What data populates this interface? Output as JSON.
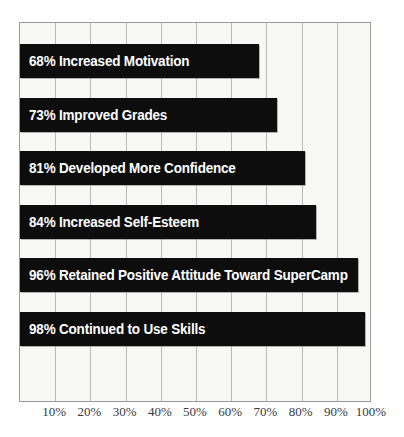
{
  "chart_data": {
    "type": "bar",
    "orientation": "horizontal",
    "title": "",
    "subtitle": "",
    "xlabel": "",
    "ylabel": "",
    "xlim": [
      0,
      100
    ],
    "grid": true,
    "legend": null,
    "value_suffix": "%",
    "categories": [
      "Increased Motivation",
      "Improved Grades",
      "Developed More Confidence",
      "Increased Self-Esteem",
      "Retained Positive Attitude Toward SuperCamp",
      "Continued to Use Skills"
    ],
    "values": [
      68,
      73,
      81,
      84,
      96,
      98
    ],
    "bar_labels": [
      "68% Increased Motivation",
      "73% Improved Grades",
      "81% Developed More Confidence",
      "84% Increased Self-Esteem",
      "96% Retained Positive Attitude Toward SuperCamp",
      "98% Continued to Use Skills"
    ],
    "xticks": [
      10,
      20,
      30,
      40,
      50,
      60,
      70,
      80,
      90,
      100
    ],
    "xtick_labels": [
      "10%",
      "20%",
      "30%",
      "40%",
      "50%",
      "60%",
      "70%",
      "80%",
      "90%",
      "100%"
    ],
    "colors": {
      "bar": "#0d0d0d",
      "bar_label_text": "#ffffff",
      "plot_background": "#f8f8f6",
      "gridline": "#b9b9b4",
      "axis_border": "#9a9a96",
      "tick_label": "#3a3a3a",
      "page_background": "#ffffff"
    }
  }
}
